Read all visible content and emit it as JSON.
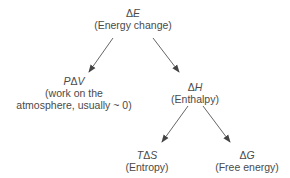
{
  "diagram": {
    "nodes": {
      "energy_change": {
        "symbol_prefix": "Δ",
        "symbol_var": "E",
        "label": "(Energy change)"
      },
      "pv_work": {
        "symbol_prefix": "P",
        "symbol_mid": "Δ",
        "symbol_var": "V",
        "label_line1": "(work on the",
        "label_line2": "atmosphere, usually ~ 0)"
      },
      "enthalpy": {
        "symbol_prefix": "Δ",
        "symbol_var": "H",
        "label": "(Enthalpy)"
      },
      "entropy": {
        "symbol_prefix": "T",
        "symbol_mid": "Δ",
        "symbol_var": "S",
        "label": "(Entropy)"
      },
      "free_energy": {
        "symbol_prefix": "Δ",
        "symbol_var": "G",
        "label": "(Free energy)"
      }
    },
    "edges": [
      {
        "from": "energy_change",
        "to": "pv_work"
      },
      {
        "from": "energy_change",
        "to": "enthalpy"
      },
      {
        "from": "enthalpy",
        "to": "entropy"
      },
      {
        "from": "enthalpy",
        "to": "free_energy"
      }
    ],
    "colors": {
      "text": "#4a4a4a",
      "arrow": "#555555"
    }
  }
}
